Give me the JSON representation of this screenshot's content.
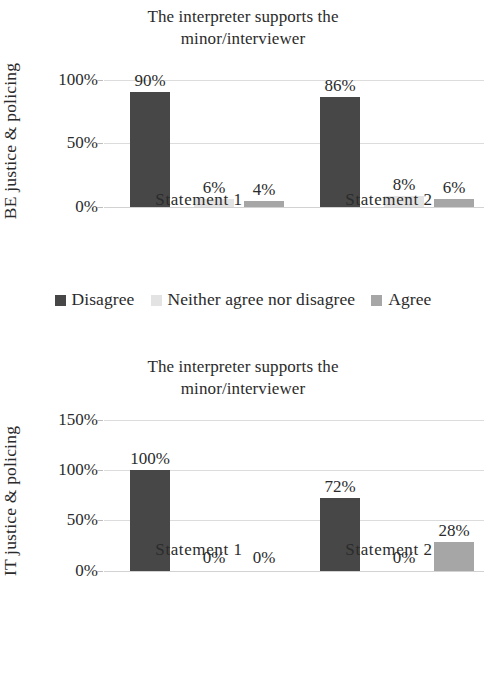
{
  "figure": {
    "background": "#ffffff",
    "series_colors": {
      "Disagree": "#474747",
      "Neither agree nor disagree": "#e3e3e3",
      "Agree": "#a6a6a6"
    }
  },
  "charts": [
    {
      "id": "be-chart",
      "title_line1": "The interpreter supports the",
      "title_line2": "minor/interviewer",
      "ylabel": "BE justice & policing",
      "yticks": [
        "0%",
        "50%",
        "100%"
      ],
      "ytick_values": [
        0,
        50,
        100
      ],
      "ymax": 100,
      "categories": [
        "Statement 1",
        "Statement 2"
      ],
      "series": [
        {
          "name": "Disagree",
          "values": [
            90,
            86
          ],
          "labels": [
            "90%",
            "86%"
          ]
        },
        {
          "name": "Neither agree nor disagree",
          "values": [
            6,
            8
          ],
          "labels": [
            "6%",
            "8%"
          ]
        },
        {
          "name": "Agree",
          "values": [
            4,
            6
          ],
          "labels": [
            "4%",
            "6%"
          ]
        }
      ]
    },
    {
      "id": "it-chart",
      "title_line1": "The interpreter supports the",
      "title_line2": "minor/interviewer",
      "ylabel": "IT justice & policing",
      "yticks": [
        "0%",
        "50%",
        "100%",
        "150%"
      ],
      "ytick_values": [
        0,
        50,
        100,
        150
      ],
      "ymax": 150,
      "categories": [
        "Statement 1",
        "Statement 2"
      ],
      "series": [
        {
          "name": "Disagree",
          "values": [
            100,
            72
          ],
          "labels": [
            "100%",
            "72%"
          ]
        },
        {
          "name": "Neither agree nor disagree",
          "values": [
            0,
            0
          ],
          "labels": [
            "0%",
            "0%"
          ]
        },
        {
          "name": "Agree",
          "values": [
            0,
            28
          ],
          "labels": [
            "0%",
            "28%"
          ]
        }
      ]
    }
  ],
  "legend": {
    "items": [
      {
        "label": "Disagree",
        "color": "#474747",
        "icon": "square-swatch-icon"
      },
      {
        "label": "Neither agree nor disagree",
        "color": "#e3e3e3",
        "icon": "square-swatch-icon"
      },
      {
        "label": "Agree",
        "color": "#a6a6a6",
        "icon": "square-swatch-icon"
      }
    ]
  },
  "chart_data": [
    {
      "type": "bar",
      "title": "The interpreter supports the minor/interviewer",
      "xlabel": "",
      "ylabel": "BE justice & policing",
      "categories": [
        "Statement 1",
        "Statement 2"
      ],
      "series": [
        {
          "name": "Disagree",
          "values": [
            90,
            86
          ]
        },
        {
          "name": "Neither agree nor disagree",
          "values": [
            6,
            8
          ]
        },
        {
          "name": "Agree",
          "values": [
            4,
            6
          ]
        }
      ],
      "ylim": [
        0,
        100
      ],
      "yticks": [
        0,
        50,
        100
      ],
      "ytick_labels": [
        "0%",
        "50%",
        "100%"
      ],
      "data_labels": [
        [
          "90%",
          "86%"
        ],
        [
          "6%",
          "8%"
        ],
        [
          "4%",
          "6%"
        ]
      ],
      "grid": true,
      "legend_position": "bottom",
      "units": "percent"
    },
    {
      "type": "bar",
      "title": "The interpreter supports the minor/interviewer",
      "xlabel": "",
      "ylabel": "IT justice & policing",
      "categories": [
        "Statement 1",
        "Statement 2"
      ],
      "series": [
        {
          "name": "Disagree",
          "values": [
            100,
            72
          ]
        },
        {
          "name": "Neither agree nor disagree",
          "values": [
            0,
            0
          ]
        },
        {
          "name": "Agree",
          "values": [
            0,
            28
          ]
        }
      ],
      "ylim": [
        0,
        150
      ],
      "yticks": [
        0,
        50,
        100,
        150
      ],
      "ytick_labels": [
        "0%",
        "50%",
        "100%",
        "150%"
      ],
      "data_labels": [
        [
          "100%",
          "72%"
        ],
        [
          "0%",
          "0%"
        ],
        [
          "0%",
          "28%"
        ]
      ],
      "grid": true,
      "legend_position": "bottom",
      "units": "percent"
    }
  ]
}
